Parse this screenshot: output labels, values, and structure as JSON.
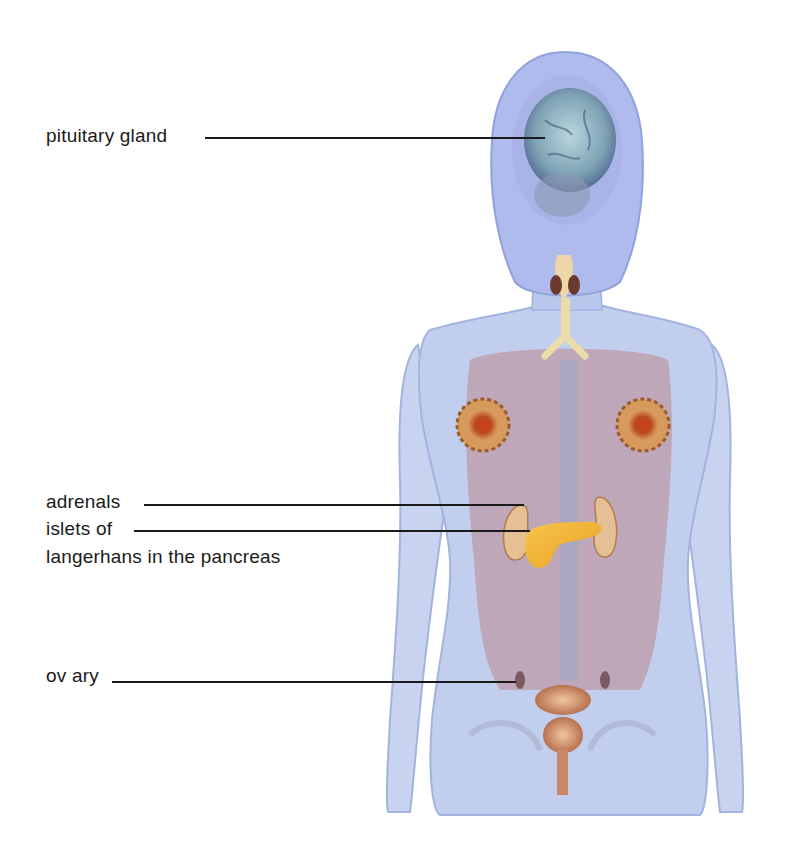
{
  "diagram": {
    "labels": [
      {
        "id": "pituitary",
        "text": "pituitary gland"
      },
      {
        "id": "adrenals",
        "text": "adrenals"
      },
      {
        "id": "islets_line1",
        "text": "islets of"
      },
      {
        "id": "islets_line2",
        "text": "langerhans in the pancreas"
      },
      {
        "id": "ovary",
        "text": "ov ary"
      }
    ]
  },
  "colors": {
    "background": "#ffffff",
    "body_outline": "#9fb0e0",
    "body_fill": "#b9c6ea",
    "organ_tissue": "#b9868e",
    "brain": "#8fb3c2",
    "pancreas": "#f0b53c",
    "kidney": "#e2b98a",
    "breast_gland": "#c7481e",
    "bladder_uterus": "#c98a63",
    "leader_line": "#1a1a1a",
    "label_text": "#1a1a1a"
  }
}
